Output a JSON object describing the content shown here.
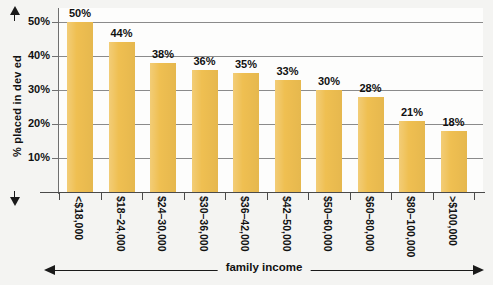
{
  "chart_data": {
    "type": "bar",
    "title": "",
    "xlabel": "family income",
    "ylabel": "% placed in dev ed",
    "categories": [
      "<$18,000",
      "$18–24,000",
      "$24–30,000",
      "$30–36,000",
      "$36–42,000",
      "$42–50,000",
      "$50–60,000",
      "$60–80,000",
      "$80–100,000",
      ">$100,000"
    ],
    "values": [
      50,
      44,
      38,
      36,
      35,
      33,
      30,
      28,
      21,
      18
    ],
    "value_labels": [
      "50%",
      "44%",
      "38%",
      "36%",
      "35%",
      "33%",
      "30%",
      "28%",
      "21%",
      "18%"
    ],
    "ylim": [
      0,
      55
    ],
    "ytick_values": [
      10,
      20,
      30,
      40,
      50
    ],
    "ytick_labels": [
      "10%",
      "20%",
      "30%",
      "40%",
      "50%"
    ],
    "grid": true,
    "legend": "none",
    "bar_color": "#efbf51",
    "gridline_color": "#8b8b8b",
    "axis_color": "#4a4a4a",
    "text_color": "#111111",
    "plot_background": "#fdfdfc",
    "page_background": "#f4f4f2"
  }
}
